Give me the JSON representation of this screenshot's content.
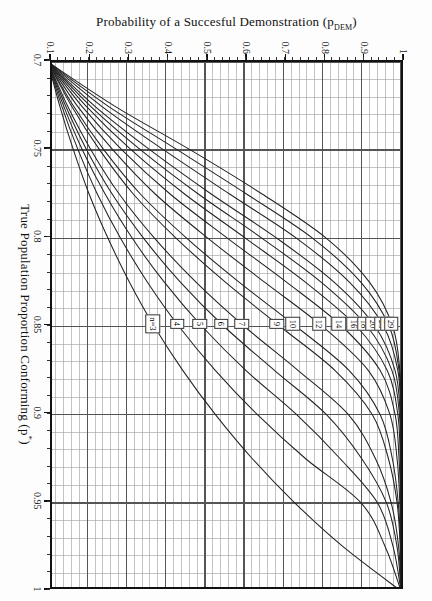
{
  "figure": {
    "background_color": "#ffffff",
    "frame_color": "#111111",
    "grid_major_color": "#555555",
    "grid_minor_color": "#aaaaaa",
    "curve_color": "#222222"
  },
  "chart_data": {
    "type": "line",
    "title": "",
    "xlabel": "True Population Proportion Conforming (p*)",
    "ylabel": "Probability of a Succesful Demonstration (p_DEM)",
    "xlim": [
      0.7,
      1.0
    ],
    "ylim": [
      0.1,
      1.0
    ],
    "grid": true,
    "grid_major_x": [
      0.7,
      0.75,
      0.8,
      0.85,
      0.9,
      0.95,
      1.0
    ],
    "grid_major_y": [
      0.1,
      0.2,
      0.3,
      0.4,
      0.5,
      0.6,
      0.7,
      0.8,
      0.9,
      1.0
    ],
    "grid_minor_x_step": 0.01,
    "grid_minor_y_step": 0.02,
    "legend_position": "inline-callouts",
    "xticks": [
      "0.7",
      "0.75",
      "0.8",
      "0.85",
      "0.9",
      "0.95",
      "1"
    ],
    "xtick_values": [
      0.7,
      0.75,
      0.8,
      0.85,
      0.9,
      0.95,
      1.0
    ],
    "yticks": [
      "0.1",
      "0.2",
      "0.3",
      "0.4",
      "0.5",
      "0.6",
      "0.7",
      "0.8",
      "0.9",
      "1"
    ],
    "ytick_values": [
      0.1,
      0.2,
      0.3,
      0.4,
      0.5,
      0.6,
      0.7,
      0.8,
      0.9,
      1.0
    ],
    "series": [
      {
        "name": "n=3",
        "label": "n=3",
        "n": 3,
        "label_at_x": 0.8485,
        "x": [
          0.7,
          0.725,
          0.75,
          0.775,
          0.8,
          0.825,
          0.85,
          0.875,
          0.9,
          0.925,
          0.95,
          0.975,
          1.0
        ],
        "y": [
          0.1,
          0.13,
          0.165,
          0.205,
          0.253,
          0.308,
          0.371,
          0.444,
          0.527,
          0.621,
          0.729,
          0.853,
          1.0
        ]
      },
      {
        "name": "4",
        "label": "4",
        "n": 4,
        "label_at_x": 0.8485,
        "x": [
          0.7,
          0.725,
          0.75,
          0.775,
          0.8,
          0.825,
          0.85,
          0.875,
          0.9,
          0.925,
          0.95,
          0.975,
          1.0
        ],
        "y": [
          0.1,
          0.135,
          0.177,
          0.226,
          0.285,
          0.354,
          0.434,
          0.527,
          0.634,
          0.757,
          0.898,
          0.96,
          1.0
        ]
      },
      {
        "name": "5",
        "label": "5",
        "n": 5,
        "label_at_x": 0.8485,
        "x": [
          0.7,
          0.725,
          0.75,
          0.775,
          0.8,
          0.825,
          0.85,
          0.875,
          0.9,
          0.925,
          0.95,
          0.975,
          1.0
        ],
        "y": [
          0.1,
          0.14,
          0.188,
          0.246,
          0.315,
          0.397,
          0.493,
          0.605,
          0.734,
          0.845,
          0.94,
          0.98,
          1.0
        ]
      },
      {
        "name": "6",
        "label": "6",
        "n": 6,
        "label_at_x": 0.8485,
        "x": [
          0.7,
          0.725,
          0.75,
          0.775,
          0.8,
          0.825,
          0.85,
          0.875,
          0.9,
          0.925,
          0.95,
          0.975,
          1.0
        ],
        "y": [
          0.1,
          0.145,
          0.199,
          0.264,
          0.344,
          0.438,
          0.549,
          0.678,
          0.81,
          0.9,
          0.963,
          0.99,
          1.0
        ]
      },
      {
        "name": "7",
        "label": "7",
        "n": 7,
        "label_at_x": 0.8485,
        "x": [
          0.7,
          0.725,
          0.75,
          0.775,
          0.8,
          0.825,
          0.85,
          0.875,
          0.9,
          0.925,
          0.95,
          0.975,
          1.0
        ],
        "y": [
          0.1,
          0.15,
          0.21,
          0.282,
          0.372,
          0.478,
          0.601,
          0.738,
          0.866,
          0.935,
          0.975,
          0.994,
          1.0
        ]
      },
      {
        "name": "9",
        "label": "9",
        "n": 9,
        "label_at_x": 0.8485,
        "x": [
          0.7,
          0.725,
          0.75,
          0.775,
          0.8,
          0.825,
          0.85,
          0.875,
          0.9,
          0.925,
          0.95,
          0.975,
          1.0
        ],
        "y": [
          0.1,
          0.16,
          0.232,
          0.318,
          0.427,
          0.553,
          0.692,
          0.832,
          0.927,
          0.968,
          0.99,
          0.998,
          1.0
        ]
      },
      {
        "name": "10",
        "label": "10",
        "n": 10,
        "label_at_x": 0.8485,
        "x": [
          0.7,
          0.725,
          0.75,
          0.775,
          0.8,
          0.825,
          0.85,
          0.875,
          0.9,
          0.925,
          0.95,
          0.975,
          1.0
        ],
        "y": [
          0.1,
          0.165,
          0.243,
          0.336,
          0.454,
          0.588,
          0.733,
          0.868,
          0.947,
          0.978,
          0.993,
          0.999,
          1.0
        ]
      },
      {
        "name": "12",
        "label": "12",
        "n": 12,
        "label_at_x": 0.8485,
        "x": [
          0.7,
          0.725,
          0.75,
          0.775,
          0.8,
          0.825,
          0.85,
          0.875,
          0.9,
          0.925,
          0.95,
          0.975,
          1.0
        ],
        "y": [
          0.1,
          0.175,
          0.266,
          0.374,
          0.508,
          0.653,
          0.8,
          0.917,
          0.972,
          0.99,
          0.997,
          0.999,
          1.0
        ]
      },
      {
        "name": "14",
        "label": "14",
        "n": 14,
        "label_at_x": 0.8485,
        "x": [
          0.7,
          0.725,
          0.75,
          0.775,
          0.8,
          0.825,
          0.85,
          0.875,
          0.9,
          0.925,
          0.95,
          0.975,
          1.0
        ],
        "y": [
          0.1,
          0.186,
          0.289,
          0.412,
          0.558,
          0.709,
          0.85,
          0.947,
          0.985,
          0.995,
          0.999,
          1.0,
          1.0
        ]
      },
      {
        "name": "16",
        "label": "16",
        "n": 16,
        "label_at_x": 0.8485,
        "x": [
          0.7,
          0.725,
          0.75,
          0.775,
          0.8,
          0.825,
          0.85,
          0.875,
          0.9,
          0.925,
          0.95,
          0.975,
          1.0
        ],
        "y": [
          0.1,
          0.197,
          0.313,
          0.449,
          0.604,
          0.757,
          0.887,
          0.965,
          0.992,
          0.998,
          1.0,
          1.0,
          1.0
        ]
      },
      {
        "name": "18",
        "label": "18",
        "n": 18,
        "label_at_x": 0.8485,
        "x": [
          0.7,
          0.725,
          0.75,
          0.775,
          0.8,
          0.825,
          0.85,
          0.875,
          0.9,
          0.925,
          0.95,
          0.975,
          1.0
        ],
        "y": [
          0.1,
          0.208,
          0.337,
          0.484,
          0.646,
          0.797,
          0.914,
          0.977,
          0.996,
          0.999,
          1.0,
          1.0,
          1.0
        ]
      },
      {
        "name": "20",
        "label": "20",
        "n": 20,
        "label_at_x": 0.8485,
        "x": [
          0.7,
          0.725,
          0.75,
          0.775,
          0.8,
          0.825,
          0.85,
          0.875,
          0.9,
          0.925,
          0.95,
          0.975,
          1.0
        ],
        "y": [
          0.1,
          0.219,
          0.361,
          0.517,
          0.684,
          0.83,
          0.934,
          0.985,
          0.998,
          1.0,
          1.0,
          1.0,
          1.0
        ]
      },
      {
        "name": "23",
        "label": "23",
        "n": 23,
        "label_at_x": 0.8485,
        "x": [
          0.7,
          0.725,
          0.75,
          0.775,
          0.8,
          0.825,
          0.85,
          0.875,
          0.9,
          0.925,
          0.95,
          0.975,
          1.0
        ],
        "y": [
          0.1,
          0.236,
          0.396,
          0.564,
          0.734,
          0.869,
          0.956,
          0.992,
          0.999,
          1.0,
          1.0,
          1.0,
          1.0
        ]
      },
      {
        "name": "26",
        "label": "26",
        "n": 26,
        "label_at_x": 0.8485,
        "x": [
          0.7,
          0.725,
          0.75,
          0.775,
          0.8,
          0.825,
          0.85,
          0.875,
          0.9,
          0.925,
          0.95,
          0.975,
          1.0
        ],
        "y": [
          0.1,
          0.253,
          0.431,
          0.607,
          0.775,
          0.898,
          0.97,
          0.995,
          1.0,
          1.0,
          1.0,
          1.0,
          1.0
        ]
      },
      {
        "name": "29",
        "label": "29",
        "n": 29,
        "label_at_x": 0.8485,
        "x": [
          0.7,
          0.725,
          0.75,
          0.775,
          0.8,
          0.825,
          0.85,
          0.875,
          0.9,
          0.925,
          0.95,
          0.975,
          1.0
        ],
        "y": [
          0.1,
          0.27,
          0.464,
          0.647,
          0.81,
          0.92,
          0.979,
          0.997,
          1.0,
          1.0,
          1.0,
          1.0,
          1.0
        ]
      }
    ],
    "curve_labels": [
      {
        "text": "29",
        "x": 0.8485,
        "y": 0.5
      },
      {
        "text": "26",
        "x": 0.8485,
        "y": 0.5
      },
      {
        "text": "23",
        "x": 0.8485,
        "y": 0.5
      },
      {
        "text": "20",
        "x": 0.8485,
        "y": 0.5
      },
      {
        "text": "18",
        "x": 0.8485,
        "y": 0.5
      },
      {
        "text": "16",
        "x": 0.8485,
        "y": 0.5
      },
      {
        "text": "14",
        "x": 0.8485,
        "y": 0.5
      },
      {
        "text": "12",
        "x": 0.8485,
        "y": 0.5
      },
      {
        "text": "10",
        "x": 0.8485,
        "y": 0.5
      },
      {
        "text": "9",
        "x": 0.8485,
        "y": 0.5
      },
      {
        "text": "7",
        "x": 0.8485,
        "y": 0.5
      },
      {
        "text": "6",
        "x": 0.8485,
        "y": 0.5
      },
      {
        "text": "5",
        "x": 0.8485,
        "y": 0.5
      },
      {
        "text": "4",
        "x": 0.8485,
        "y": 0.5
      },
      {
        "text": "n=3",
        "x": 0.8485,
        "y": 0.5
      }
    ]
  },
  "axis": {
    "x_title_main": "True Population Proportion Conforming (p",
    "x_title_sup": "*",
    "x_title_tail": ")",
    "y_title_main": "Probability of a Succesful Demonstration (p",
    "y_title_sub": "DEM",
    "y_title_tail": ")"
  }
}
